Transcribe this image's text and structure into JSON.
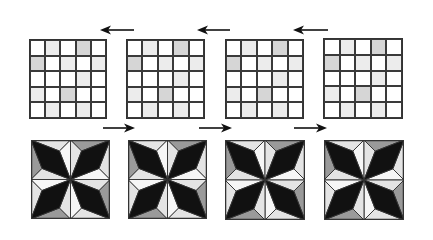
{
  "colors": {
    "white": "#ffffff",
    "light": "#ececec",
    "gray": "#d6d6d6",
    "line": "#333333",
    "dark": "#111111",
    "tile_light": "#e4e4e4",
    "tile_mid": "#9a9a9a",
    "tile_white": "#f6f6f6"
  },
  "grids": [
    {
      "x": 29,
      "y": 39,
      "w": 78,
      "h": 80,
      "cells": [
        [
          "white",
          "light",
          "white",
          "gray",
          "white"
        ],
        [
          "gray",
          "white",
          "light",
          "white",
          "light"
        ],
        [
          "white",
          "white",
          "white",
          "light",
          "white"
        ],
        [
          "light",
          "white",
          "gray",
          "white",
          "white"
        ],
        [
          "white",
          "light",
          "white",
          "light",
          "white"
        ]
      ]
    },
    {
      "x": 126,
      "y": 39,
      "w": 79,
      "h": 80,
      "cells": [
        [
          "white",
          "light",
          "white",
          "gray",
          "white"
        ],
        [
          "gray",
          "white",
          "light",
          "white",
          "light"
        ],
        [
          "white",
          "white",
          "white",
          "light",
          "white"
        ],
        [
          "light",
          "white",
          "gray",
          "white",
          "white"
        ],
        [
          "white",
          "light",
          "white",
          "light",
          "white"
        ]
      ]
    },
    {
      "x": 225,
      "y": 39,
      "w": 79,
      "h": 80,
      "cells": [
        [
          "white",
          "light",
          "white",
          "gray",
          "white"
        ],
        [
          "gray",
          "white",
          "light",
          "white",
          "light"
        ],
        [
          "white",
          "white",
          "white",
          "light",
          "white"
        ],
        [
          "light",
          "white",
          "gray",
          "white",
          "white"
        ],
        [
          "white",
          "light",
          "white",
          "light",
          "white"
        ]
      ]
    },
    {
      "x": 323,
      "y": 38,
      "w": 80,
      "h": 81,
      "cells": [
        [
          "white",
          "light",
          "white",
          "gray",
          "white"
        ],
        [
          "gray",
          "white",
          "light",
          "white",
          "light"
        ],
        [
          "white",
          "white",
          "white",
          "light",
          "white"
        ],
        [
          "light",
          "white",
          "gray",
          "white",
          "white"
        ],
        [
          "white",
          "light",
          "white",
          "light",
          "white"
        ]
      ]
    }
  ],
  "arrows_left": [
    {
      "x1": 134,
      "x2": 100,
      "y": 30
    },
    {
      "x1": 230,
      "x2": 197,
      "y": 30
    },
    {
      "x1": 328,
      "x2": 293,
      "y": 30
    }
  ],
  "arrows_right": [
    {
      "x1": 103,
      "x2": 135,
      "y": 128
    },
    {
      "x1": 199,
      "x2": 232,
      "y": 128
    },
    {
      "x1": 294,
      "x2": 327,
      "y": 128
    }
  ],
  "tiles": [
    {
      "x": 31,
      "y": 140,
      "size": 79
    },
    {
      "x": 128,
      "y": 140,
      "size": 79
    },
    {
      "x": 225,
      "y": 140,
      "size": 80
    },
    {
      "x": 324,
      "y": 140,
      "size": 80
    }
  ]
}
